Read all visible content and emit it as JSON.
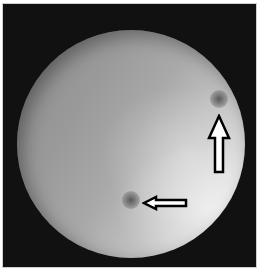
{
  "image": {
    "description": "Circular grayscale fundus/endoscopic photograph on dark background with two outlined arrows pointing at dark spots",
    "colors": {
      "background": "#111111",
      "border": "#cfcfcf",
      "arrow_fill": "#ffffff",
      "arrow_stroke": "#000000",
      "lesion": "#555555"
    },
    "annotations": [
      {
        "type": "arrow",
        "direction": "up",
        "target": "lesion-upper-right"
      },
      {
        "type": "arrow",
        "direction": "left",
        "target": "lesion-lower-center"
      }
    ],
    "lesions": [
      {
        "id": "lesion-upper-right"
      },
      {
        "id": "lesion-lower-center"
      }
    ]
  }
}
